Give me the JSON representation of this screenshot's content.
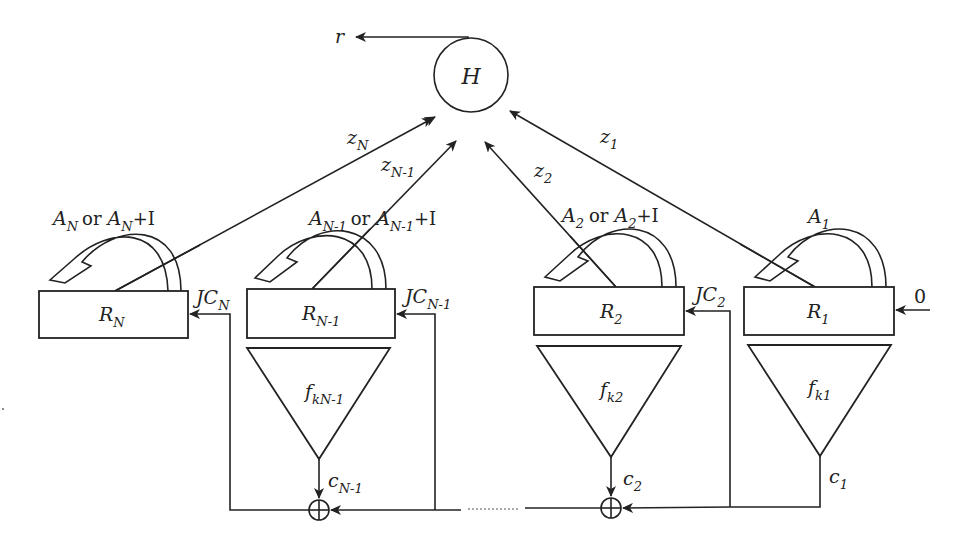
{
  "diagram": {
    "output": {
      "label": "r"
    },
    "hub": {
      "label": "H"
    },
    "initial_input": {
      "label": "0"
    },
    "registers": [
      {
        "id": "N",
        "name": "R",
        "sub": "N",
        "jc": "JC",
        "jc_sub": "N",
        "z": "z",
        "z_sub": "N",
        "fb_pre": "A",
        "fb_sub": "N",
        "fb_or": "or",
        "fb_post_pre": "A",
        "fb_post_sub": "N",
        "fb_plus": "+I"
      },
      {
        "id": "N-1",
        "name": "R",
        "sub": "N-1",
        "jc": "JC",
        "jc_sub": "N-1",
        "z": "z",
        "z_sub": "N-1",
        "fb_pre": "A",
        "fb_sub": "N-1",
        "fb_or": "or",
        "fb_post_pre": "A",
        "fb_post_sub": "N-1",
        "fb_plus": "+I",
        "f": "f",
        "f_sub": "kN-1",
        "c": "c",
        "c_sub": "N-1"
      },
      {
        "id": "2",
        "name": "R",
        "sub": "2",
        "jc": "JC",
        "jc_sub": "2",
        "z": "z",
        "z_sub": "2",
        "fb_pre": "A",
        "fb_sub": "2",
        "fb_or": "or",
        "fb_post_pre": "A",
        "fb_post_sub": "2",
        "fb_plus": "+I",
        "f": "f",
        "f_sub": "k2",
        "c": "c",
        "c_sub": "2"
      },
      {
        "id": "1",
        "name": "R",
        "sub": "1",
        "z": "z",
        "z_sub": "1",
        "fb_pre": "A",
        "fb_sub": "1",
        "f": "f",
        "f_sub": "k1",
        "c": "c",
        "c_sub": "1"
      }
    ],
    "adders": [
      {
        "symbol": "⊕",
        "position": "N-1"
      },
      {
        "symbol": "⊕",
        "position": "2"
      }
    ],
    "ellipsis": "......"
  }
}
